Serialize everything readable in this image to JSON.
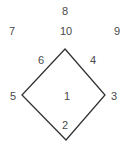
{
  "diagram": {
    "type": "diamond-numbered-positions",
    "colors": {
      "line": "#333333",
      "text": "#4a4a4a",
      "background": "#ffffff"
    },
    "shape": {
      "name": "diamond",
      "vertices": {
        "top": [
          65,
          49
        ],
        "right": [
          105,
          95
        ],
        "bottom": [
          66,
          140
        ],
        "left": [
          22,
          95
        ]
      }
    },
    "labels": [
      {
        "id": "label-1",
        "text": "1",
        "x": 67,
        "y": 96,
        "position": "center"
      },
      {
        "id": "label-2",
        "text": "2",
        "x": 65,
        "y": 125,
        "position": "bottom-inside"
      },
      {
        "id": "label-3",
        "text": "3",
        "x": 114,
        "y": 96,
        "position": "right-vertex"
      },
      {
        "id": "label-4",
        "text": "4",
        "x": 93,
        "y": 60,
        "position": "upper-right-edge"
      },
      {
        "id": "label-5",
        "text": "5",
        "x": 13,
        "y": 96,
        "position": "left-vertex"
      },
      {
        "id": "label-6",
        "text": "6",
        "x": 41,
        "y": 60,
        "position": "upper-left-edge"
      },
      {
        "id": "label-7",
        "text": "7",
        "x": 12,
        "y": 31,
        "position": "top-left"
      },
      {
        "id": "label-8",
        "text": "8",
        "x": 65,
        "y": 11,
        "position": "top"
      },
      {
        "id": "label-9",
        "text": "9",
        "x": 117,
        "y": 31,
        "position": "top-right"
      },
      {
        "id": "label-10",
        "text": "10",
        "x": 66,
        "y": 31,
        "position": "above-top-vertex"
      }
    ]
  }
}
